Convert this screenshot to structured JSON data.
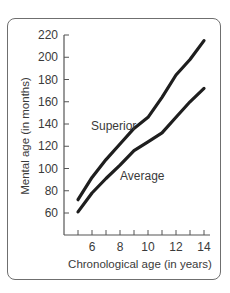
{
  "chart_data": {
    "type": "line",
    "title": "",
    "xlabel": "Chronological age (in years)",
    "ylabel": "Mental age (in months)",
    "xlim": [
      5,
      14
    ],
    "ylim": [
      60,
      220
    ],
    "x_ticks": [
      6,
      8,
      10,
      12,
      14
    ],
    "x_minor_ticks": [
      5,
      6,
      7,
      8,
      9,
      10,
      11,
      12,
      13,
      14
    ],
    "y_ticks": [
      60,
      80,
      100,
      120,
      140,
      160,
      180,
      200,
      220
    ],
    "grid": false,
    "legend": "inline labels",
    "x": [
      5,
      6,
      7,
      8,
      9,
      10,
      11,
      12,
      13,
      14
    ],
    "series": [
      {
        "name": "Superior",
        "values": [
          72,
          92,
          108,
          122,
          136,
          146,
          164,
          184,
          198,
          215
        ]
      },
      {
        "name": "Average",
        "values": [
          61,
          78,
          91,
          103,
          116,
          124,
          132,
          146,
          160,
          172
        ]
      }
    ]
  },
  "labels": {
    "superior": "Superior",
    "average": "Average",
    "x_axis_title": "Chronological age (in years)",
    "y_axis_title": "Mental age (in months)"
  }
}
